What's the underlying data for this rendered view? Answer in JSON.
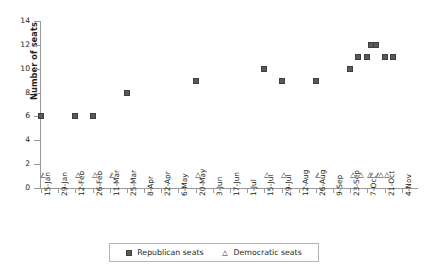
{
  "chart_data": {
    "type": "scatter",
    "title": "",
    "xlabel": "",
    "ylabel": "Number of seats",
    "ylim": [
      0,
      14
    ],
    "yticks": [
      0,
      2,
      4,
      6,
      8,
      10,
      12,
      14
    ],
    "grid": false,
    "legend_position": "bottom",
    "categories": [
      "15-Jan",
      "29-Jan",
      "12-Feb",
      "26-Feb",
      "11-Mar",
      "25-Mar",
      "8-Apr",
      "22-Apr",
      "6-May",
      "20-May",
      "3-Jun",
      "17-Jun",
      "1-Jul",
      "15-Jul",
      "29-Jul",
      "12-Aug",
      "26-Aug",
      "9-Sep",
      "23-Sep",
      "7-Oct",
      "21-Oct",
      "4-Nov"
    ],
    "series": [
      {
        "name": "Republican seats",
        "marker": "filled-square",
        "color": "#595959",
        "points": [
          {
            "x": "15-Jan",
            "y": 6
          },
          {
            "x": "12-Feb",
            "y": 6
          },
          {
            "x": "26-Feb",
            "y": 6
          },
          {
            "x": "25-Mar",
            "y": 8
          },
          {
            "x": "20-May",
            "y": 9
          },
          {
            "x": "15-Jul",
            "y": 10
          },
          {
            "x": "29-Jul",
            "y": 9
          },
          {
            "x": "26-Aug",
            "y": 9
          },
          {
            "x": "23-Sep",
            "y": 10
          },
          {
            "x": "30-Sep",
            "y": 11
          },
          {
            "x": "7-Oct",
            "y": 11
          },
          {
            "x": "10-Oct",
            "y": 12
          },
          {
            "x": "14-Oct",
            "y": 12
          },
          {
            "x": "21-Oct",
            "y": 11
          },
          {
            "x": "28-Oct",
            "y": 11
          }
        ]
      },
      {
        "name": "Democratic seats",
        "marker": "open-triangle",
        "color": "#8a8a8a",
        "points": [
          {
            "x": "15-Jan",
            "y": 1
          },
          {
            "x": "12-Feb",
            "y": 1
          },
          {
            "x": "26-Feb",
            "y": 1
          },
          {
            "x": "11-Mar",
            "y": 1
          },
          {
            "x": "20-May",
            "y": 1
          },
          {
            "x": "15-Jul",
            "y": 1
          },
          {
            "x": "29-Jul",
            "y": 1
          },
          {
            "x": "26-Aug",
            "y": 1
          },
          {
            "x": "23-Sep",
            "y": 1
          },
          {
            "x": "30-Sep",
            "y": 1
          },
          {
            "x": "7-Oct",
            "y": 1
          },
          {
            "x": "9-Oct",
            "y": 1
          },
          {
            "x": "14-Oct",
            "y": 1
          },
          {
            "x": "16-Oct",
            "y": 1
          },
          {
            "x": "21-Oct",
            "y": 1
          }
        ]
      }
    ]
  },
  "legend": {
    "entries": [
      {
        "label": "Republican seats"
      },
      {
        "label": "Democratic seats"
      }
    ]
  }
}
